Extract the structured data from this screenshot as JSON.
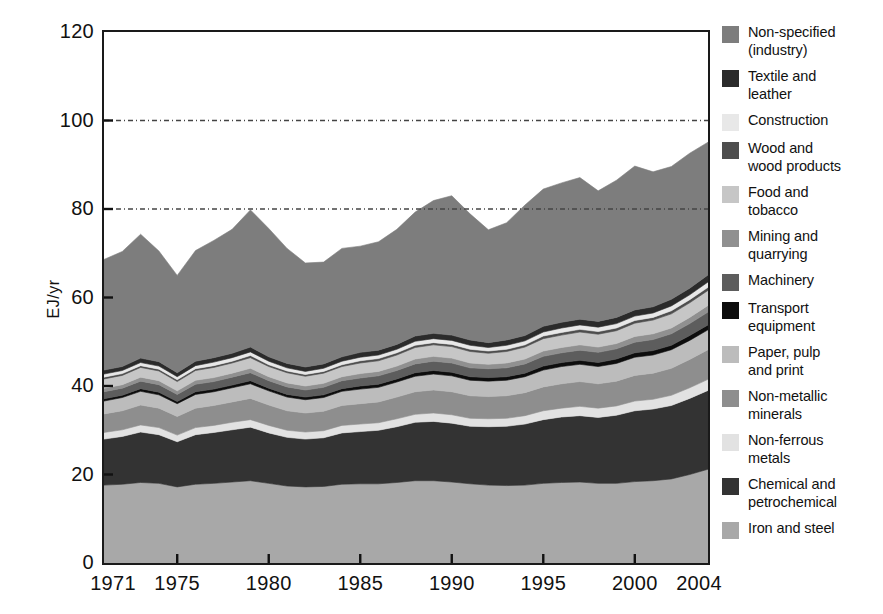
{
  "chart_data": {
    "type": "area",
    "title": "",
    "xlabel": "",
    "ylabel": "EJ/yr",
    "xlim": [
      1971,
      2004
    ],
    "ylim": [
      0,
      120
    ],
    "ytick_labels": [
      "0",
      "20",
      "40",
      "60",
      "80",
      "100",
      "120"
    ],
    "ytick_values": [
      0,
      20,
      40,
      60,
      80,
      100,
      120
    ],
    "xtick_labels": [
      "1971",
      "1975",
      "1980",
      "1985",
      "1990",
      "1995",
      "2000",
      "2004"
    ],
    "xtick_values": [
      1971,
      1975,
      1980,
      1985,
      1990,
      1995,
      2000,
      2004
    ],
    "gridlines": [
      80,
      100
    ],
    "grid": "dotted-horizontal",
    "legend_position": "right",
    "stacking": "bottom-to-top",
    "x": [
      1971,
      1972,
      1973,
      1974,
      1975,
      1976,
      1977,
      1978,
      1979,
      1980,
      1981,
      1982,
      1983,
      1984,
      1985,
      1986,
      1987,
      1988,
      1989,
      1990,
      1991,
      1992,
      1993,
      1994,
      1995,
      1996,
      1997,
      1998,
      1999,
      2000,
      2001,
      2002,
      2003,
      2004
    ],
    "series": [
      {
        "name": "Iron and steel",
        "color": "#a8a8a8",
        "values": [
          17.6,
          17.8,
          18.2,
          18.0,
          17.2,
          17.8,
          18.0,
          18.3,
          18.6,
          18.0,
          17.4,
          17.2,
          17.3,
          17.8,
          17.9,
          17.9,
          18.2,
          18.6,
          18.6,
          18.3,
          17.9,
          17.6,
          17.5,
          17.6,
          18.0,
          18.2,
          18.3,
          18.0,
          18.0,
          18.4,
          18.6,
          19.0,
          20.0,
          21.2
        ]
      },
      {
        "name": "Chemical and petrochemical",
        "color": "#333333",
        "values": [
          10.4,
          10.8,
          11.4,
          11.0,
          10.2,
          11.2,
          11.5,
          11.8,
          12.1,
          11.4,
          11.0,
          10.8,
          11.0,
          11.6,
          11.8,
          12.1,
          12.6,
          13.2,
          13.4,
          13.3,
          13.0,
          13.2,
          13.4,
          13.8,
          14.4,
          14.8,
          15.0,
          14.9,
          15.4,
          16.0,
          16.2,
          16.6,
          17.2,
          17.8
        ]
      },
      {
        "name": "Non-ferrous metals",
        "color": "#e2e2e2",
        "values": [
          1.5,
          1.5,
          1.6,
          1.6,
          1.5,
          1.6,
          1.6,
          1.7,
          1.7,
          1.7,
          1.6,
          1.6,
          1.6,
          1.7,
          1.7,
          1.7,
          1.8,
          1.8,
          1.9,
          1.9,
          1.8,
          1.8,
          1.8,
          1.9,
          2.0,
          2.0,
          2.1,
          2.1,
          2.1,
          2.2,
          2.2,
          2.3,
          2.4,
          2.5
        ]
      },
      {
        "name": "Non-metallic minerals",
        "color": "#8e8e8e",
        "values": [
          4.2,
          4.3,
          4.5,
          4.4,
          4.2,
          4.4,
          4.5,
          4.6,
          4.8,
          4.6,
          4.4,
          4.3,
          4.4,
          4.5,
          4.6,
          4.7,
          4.9,
          5.1,
          5.2,
          5.2,
          5.1,
          5.0,
          5.1,
          5.2,
          5.4,
          5.5,
          5.6,
          5.5,
          5.6,
          5.8,
          5.9,
          6.1,
          6.4,
          6.7
        ]
      },
      {
        "name": "Paper, pulp and print",
        "color": "#bcbcbc",
        "values": [
          2.9,
          3.0,
          3.1,
          3.0,
          2.9,
          3.1,
          3.1,
          3.2,
          3.3,
          3.2,
          3.1,
          3.0,
          3.1,
          3.2,
          3.3,
          3.3,
          3.4,
          3.5,
          3.6,
          3.6,
          3.5,
          3.5,
          3.5,
          3.6,
          3.8,
          3.9,
          3.9,
          3.9,
          4.0,
          4.1,
          4.1,
          4.2,
          4.3,
          4.5
        ]
      },
      {
        "name": "Transport equipment",
        "color": "#0d0d0d",
        "values": [
          0.5,
          0.5,
          0.6,
          0.6,
          0.5,
          0.6,
          0.6,
          0.6,
          0.7,
          0.6,
          0.6,
          0.6,
          0.6,
          0.6,
          0.7,
          0.7,
          0.7,
          0.8,
          0.8,
          0.8,
          0.8,
          0.8,
          0.8,
          0.8,
          0.9,
          0.9,
          0.9,
          0.9,
          1.0,
          1.0,
          1.0,
          1.0,
          1.1,
          1.1
        ]
      },
      {
        "name": "Machinery",
        "color": "#5d5d5d",
        "values": [
          1.6,
          1.6,
          1.7,
          1.7,
          1.6,
          1.7,
          1.7,
          1.8,
          1.8,
          1.7,
          1.7,
          1.6,
          1.7,
          1.8,
          1.8,
          1.9,
          1.9,
          2.0,
          2.1,
          2.1,
          2.0,
          2.0,
          2.0,
          2.1,
          2.2,
          2.2,
          2.3,
          2.3,
          2.3,
          2.4,
          2.5,
          2.6,
          2.7,
          2.9
        ]
      },
      {
        "name": "Mining and quarrying",
        "color": "#909090",
        "values": [
          0.8,
          0.8,
          0.9,
          0.9,
          0.8,
          0.9,
          0.9,
          0.9,
          1.0,
          0.9,
          0.9,
          0.9,
          0.9,
          0.9,
          1.0,
          1.0,
          1.0,
          1.1,
          1.1,
          1.1,
          1.1,
          1.0,
          1.1,
          1.1,
          1.2,
          1.2,
          1.2,
          1.2,
          1.2,
          1.3,
          1.3,
          1.3,
          1.4,
          1.5
        ]
      },
      {
        "name": "Food and tobacco",
        "color": "#c6c6c6",
        "values": [
          2.1,
          2.1,
          2.2,
          2.2,
          2.1,
          2.2,
          2.3,
          2.3,
          2.4,
          2.3,
          2.3,
          2.2,
          2.3,
          2.3,
          2.4,
          2.4,
          2.5,
          2.6,
          2.6,
          2.6,
          2.6,
          2.5,
          2.6,
          2.7,
          2.8,
          2.8,
          2.9,
          2.9,
          2.9,
          3.0,
          3.1,
          3.2,
          3.3,
          3.4
        ]
      },
      {
        "name": "Wood and wood products",
        "color": "#4e4e4e",
        "values": [
          0.4,
          0.4,
          0.4,
          0.4,
          0.4,
          0.4,
          0.4,
          0.4,
          0.5,
          0.4,
          0.4,
          0.4,
          0.4,
          0.4,
          0.5,
          0.5,
          0.5,
          0.5,
          0.5,
          0.5,
          0.5,
          0.5,
          0.5,
          0.5,
          0.6,
          0.6,
          0.6,
          0.6,
          0.6,
          0.6,
          0.6,
          0.7,
          0.7,
          0.7
        ]
      },
      {
        "name": "Construction",
        "color": "#e8e8e8",
        "values": [
          0.7,
          0.7,
          0.7,
          0.7,
          0.7,
          0.7,
          0.8,
          0.8,
          0.8,
          0.8,
          0.7,
          0.7,
          0.7,
          0.8,
          0.8,
          0.8,
          0.8,
          0.9,
          0.9,
          0.9,
          0.9,
          0.8,
          0.9,
          0.9,
          0.9,
          1.0,
          1.0,
          1.0,
          1.0,
          1.0,
          1.0,
          1.1,
          1.1,
          1.2
        ]
      },
      {
        "name": "Textile and leather",
        "color": "#2b2b2b",
        "values": [
          0.9,
          0.9,
          1.0,
          1.0,
          0.9,
          1.0,
          1.0,
          1.0,
          1.1,
          1.0,
          1.0,
          1.0,
          1.0,
          1.0,
          1.1,
          1.1,
          1.1,
          1.2,
          1.2,
          1.2,
          1.2,
          1.1,
          1.2,
          1.2,
          1.3,
          1.3,
          1.3,
          1.3,
          1.4,
          1.4,
          1.4,
          1.5,
          1.5,
          1.6
        ]
      },
      {
        "name": "Non-specified (industry)",
        "color": "#7d7d7d",
        "values": [
          25.0,
          26.0,
          28.0,
          25.0,
          22.0,
          25.0,
          26.5,
          28.0,
          31.0,
          29.0,
          26.0,
          23.5,
          23.0,
          24.5,
          24.0,
          24.5,
          26.0,
          28.0,
          30.0,
          31.5,
          28.5,
          25.5,
          26.5,
          29.5,
          31.0,
          31.5,
          32.0,
          29.5,
          31.0,
          32.5,
          30.5,
          30.0,
          30.5,
          30.0
        ]
      }
    ]
  },
  "legend": {
    "items": [
      {
        "label": "Non-specified\n(industry)",
        "color": "#7d7d7d"
      },
      {
        "label": "Textile and\nleather",
        "color": "#2b2b2b"
      },
      {
        "label": "Construction",
        "color": "#e8e8e8"
      },
      {
        "label": "Wood and\nwood products",
        "color": "#4e4e4e"
      },
      {
        "label": "Food and\ntobacco",
        "color": "#c6c6c6"
      },
      {
        "label": "Mining and\nquarrying",
        "color": "#909090"
      },
      {
        "label": "Machinery",
        "color": "#5d5d5d"
      },
      {
        "label": "Transport\nequipment",
        "color": "#0d0d0d"
      },
      {
        "label": "Paper, pulp\nand print",
        "color": "#bcbcbc"
      },
      {
        "label": "Non-metallic\nminerals",
        "color": "#8e8e8e"
      },
      {
        "label": "Non-ferrous\nmetals",
        "color": "#e2e2e2"
      },
      {
        "label": "Chemical and\npetrochemical",
        "color": "#333333"
      },
      {
        "label": "Iron and steel",
        "color": "#a8a8a8"
      }
    ]
  },
  "axes": {
    "frame_color": "#1a1a1a",
    "grid_color": "#444444"
  }
}
